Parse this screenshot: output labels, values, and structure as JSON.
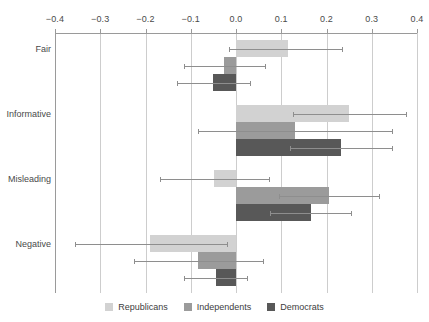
{
  "chart_data": {
    "type": "bar",
    "orientation": "horizontal",
    "title": "",
    "subtitle": "",
    "xlabel": "",
    "ylabel": "",
    "xlim": [
      -0.4,
      0.4
    ],
    "xticks": [
      -0.4,
      -0.3,
      -0.2,
      -0.1,
      0.0,
      0.1,
      0.2,
      0.3,
      0.4
    ],
    "xticklabels": [
      "−0.4",
      "−0.3",
      "−0.2",
      "−0.1",
      "0.0",
      "0.1",
      "0.2",
      "0.3",
      "0.4"
    ],
    "grid": "vertical",
    "legend_position": "bottom",
    "categories": [
      "Fair",
      "Informative",
      "Misleading",
      "Negative"
    ],
    "series": [
      {
        "name": "Republicans",
        "color": "#d2d2d2",
        "values": [
          0.115,
          0.25,
          -0.048,
          -0.19
        ],
        "errors_low": [
          -0.015,
          0.125,
          -0.168,
          -0.355
        ],
        "errors_high": [
          0.235,
          0.375,
          0.072,
          -0.02
        ]
      },
      {
        "name": "Independents",
        "color": "#9b9b9b",
        "values": [
          -0.026,
          0.13,
          0.205,
          -0.085
        ],
        "errors_low": [
          -0.116,
          -0.085,
          0.095,
          -0.225
        ],
        "errors_high": [
          0.064,
          0.345,
          0.315,
          0.06
        ]
      },
      {
        "name": "Democrats",
        "color": "#585858",
        "values": [
          -0.05,
          0.232,
          0.165,
          -0.045
        ],
        "errors_low": [
          -0.13,
          0.12,
          0.075,
          -0.115
        ],
        "errors_high": [
          0.03,
          0.344,
          0.255,
          0.025
        ]
      }
    ]
  },
  "legend": {
    "entries": [
      {
        "label": "Republicans",
        "color": "#d2d2d2"
      },
      {
        "label": "Independents",
        "color": "#9b9b9b"
      },
      {
        "label": "Democrats",
        "color": "#585858"
      }
    ]
  },
  "axes": {
    "tick_color": "#4a4a4a",
    "grid_color": "#cdcdcd",
    "spine_color": "#9a9a9a",
    "errorbar_color": "#8e8e8e"
  }
}
